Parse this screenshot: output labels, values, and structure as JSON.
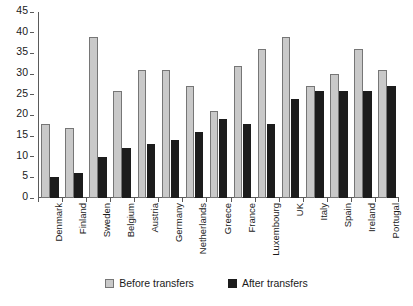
{
  "chart_data": {
    "type": "bar",
    "title": "",
    "xlabel": "",
    "ylabel": "",
    "ylim": [
      0,
      45
    ],
    "ytick_step": 5,
    "yticks": [
      0,
      5,
      10,
      15,
      20,
      25,
      30,
      35,
      40,
      45
    ],
    "grid": false,
    "legend_position": "bottom",
    "categories": [
      "Denmark",
      "Finland",
      "Sweden",
      "Belgium",
      "Austria",
      "Germany",
      "Netherlands",
      "Greece",
      "France",
      "Luxembourg",
      "UK",
      "Italy",
      "Spain",
      "Ireland",
      "Portugal"
    ],
    "series": [
      {
        "name": "Before transfers",
        "color": "#c9c9c9",
        "values": [
          18,
          17,
          39,
          26,
          31,
          31,
          27,
          21,
          32,
          36,
          39,
          27,
          30,
          36,
          31
        ]
      },
      {
        "name": "After transfers",
        "color": "#1c1c1c",
        "values": [
          5,
          6,
          10,
          12,
          13,
          14,
          16,
          19,
          18,
          18,
          24,
          26,
          26,
          26,
          27
        ]
      }
    ]
  },
  "legend": {
    "items": [
      {
        "label": "Before transfers",
        "swatch": "before"
      },
      {
        "label": "After transfers",
        "swatch": "after"
      }
    ]
  }
}
